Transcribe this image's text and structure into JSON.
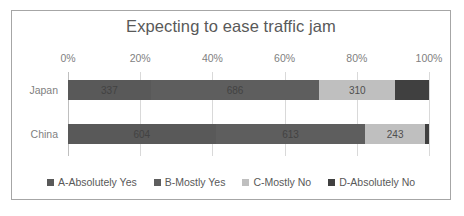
{
  "chart_data": {
    "type": "bar",
    "orientation": "horizontal",
    "stacked": true,
    "normalized": true,
    "title": "Expecting to ease traffic jam",
    "xlabel": "",
    "ylabel": "",
    "categories": [
      "Japan",
      "China"
    ],
    "tick_labels": [
      "0%",
      "20%",
      "40%",
      "60%",
      "80%",
      "100%"
    ],
    "tick_values": [
      0,
      20,
      40,
      60,
      80,
      100
    ],
    "xlim": [
      0,
      100
    ],
    "grid": true,
    "legend_position": "bottom",
    "series": [
      {
        "name": "A-Absolutely Yes",
        "color": "#595959",
        "values": [
          337,
          604
        ],
        "labels": [
          "337",
          "604"
        ],
        "percents": [
          24.2,
          41.0
        ]
      },
      {
        "name": "B-Mostly Yes",
        "color": "#5e5e5e",
        "values": [
          686,
          613
        ],
        "labels": [
          "686",
          "613"
        ],
        "percents": [
          49.4,
          41.5
        ]
      },
      {
        "name": "C-Mostly No",
        "color": "#bfbfbf",
        "values": [
          310,
          243
        ],
        "labels": [
          "310",
          "243"
        ],
        "percents": [
          22.3,
          16.5
        ]
      },
      {
        "name": "D-Absolutely No",
        "color": "#404040",
        "values": [
          137,
          17
        ],
        "labels": [
          "137",
          ""
        ],
        "percents": [
          9.9,
          1.0
        ]
      }
    ]
  }
}
